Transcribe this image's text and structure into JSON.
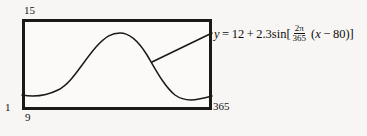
{
  "figure": {
    "type": "graphing-window"
  },
  "window": {
    "ymax_label": "15",
    "ymin_label": "1",
    "xmin_label": "9",
    "xmax_label": "365"
  },
  "equation": {
    "lhs": "y",
    "equals": "=",
    "vertical_shift": "12",
    "plus": "+",
    "amplitude": "2.3",
    "function": "sin",
    "open_bracket": "[",
    "frac_numerator": "2π",
    "frac_denominator": "365",
    "open_paren": "(",
    "variable": "x",
    "minus": "−",
    "phase_shift": "80",
    "close_paren": ")",
    "close_bracket": "]",
    "full_text": "y = 12 + 2.3sin[(2π/365)(x − 80)]"
  },
  "colors": {
    "ink": "#1a1916",
    "paper": "#f7f6f4",
    "plot_background": "#fbfaf8"
  },
  "chart_data": {
    "type": "line",
    "title": "",
    "xlabel": "",
    "ylabel": "",
    "xlim": [
      9,
      365
    ],
    "ylim": [
      1,
      15
    ],
    "grid": false,
    "legend": null,
    "annotations": [
      {
        "text": "y = 12 + 2.3sin[(2π/365)(x − 80)]",
        "leader_from": [
          152,
          62
        ],
        "leader_to": [
          212,
          33
        ]
      }
    ],
    "series": [
      {
        "name": "y = 12 + 2.3sin[(2π/365)(x - 80)]",
        "amplitude": 2.3,
        "midline": 12,
        "period": 365,
        "phase_shift": 80,
        "x": [
          9,
          35,
          60,
          80,
          105,
          130,
          155,
          171,
          195,
          220,
          245,
          262,
          285,
          310,
          335,
          365
        ],
        "y": [
          9.8,
          10.1,
          10.9,
          12.0,
          13.2,
          14.0,
          14.3,
          14.3,
          13.8,
          12.7,
          11.3,
          10.4,
          9.8,
          9.7,
          9.7,
          9.8
        ]
      }
    ],
    "curve_path_px": "M 22 95 C 34 97 46 96 58 90 C 72 83 82 63 96 47 C 106 36 112 33 120 33 C 130 33 139 42 147 55 C 156 70 164 86 175 95 C 182 100 190 101 199 99 C 205 98 209 97 212 96"
  }
}
